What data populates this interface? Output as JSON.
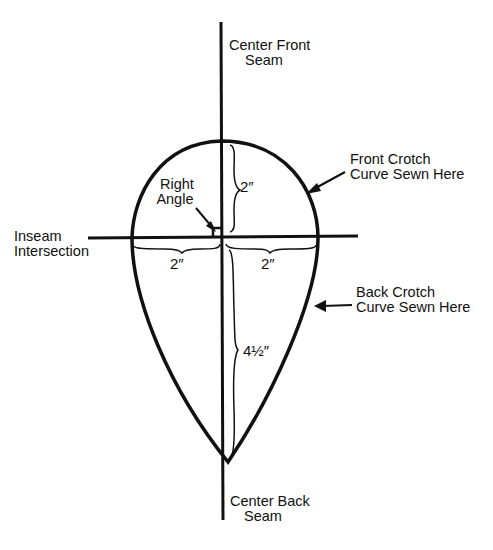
{
  "diagram": {
    "labels": {
      "center_front_seam": [
        "Center Front",
        "Seam"
      ],
      "center_back_seam": [
        "Center Back",
        "Seam"
      ],
      "front_crotch_curve": [
        "Front Crotch",
        "Curve Sewn Here"
      ],
      "back_crotch_curve": [
        "Back Crotch",
        "Curve Sewn Here"
      ],
      "inseam_intersection": [
        "Inseam",
        "Intersection"
      ],
      "right_angle": [
        "Right",
        "Angle"
      ]
    },
    "dimensions": {
      "front_depth": "2″",
      "left_width": "2″",
      "right_width": "2″",
      "back_depth": "4½″"
    },
    "colors": {
      "ink": "#111111",
      "paper": "#ffffff"
    }
  }
}
